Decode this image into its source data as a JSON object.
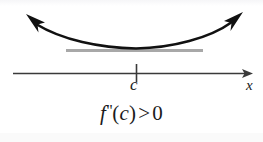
{
  "figure": {
    "background_color": "#ffffff",
    "width": 263,
    "height": 142
  },
  "axis": {
    "name": "x-axis",
    "label": "x",
    "color": "#3a3a3a",
    "y": 73,
    "x_start": 13,
    "x_end": 252,
    "arrow": "right-arrow"
  },
  "tick": {
    "name": "tick-c",
    "label": "c",
    "x": 136,
    "color": "#3a3a3a"
  },
  "curve": {
    "name": "parabola-curve",
    "color": "#111111",
    "shape": "concave-up-parabola",
    "vertex_x": 136,
    "vertex_y": 48,
    "left_arrow": "up-left-arrow",
    "right_arrow": "up-right-arrow"
  },
  "tangent": {
    "name": "tangent-line",
    "color": "#a8a8a8",
    "y": 50,
    "x_start": 66,
    "x_end": 203
  },
  "formula": {
    "function": "f",
    "prime": "\"",
    "open_paren": "(",
    "argument": "c",
    "close_paren": ")",
    "operator": ">",
    "value": "0",
    "full_text": "f\"(c) > 0"
  }
}
